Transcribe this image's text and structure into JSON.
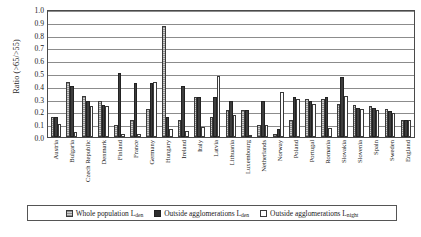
{
  "chart_data": {
    "type": "bar",
    "title": "",
    "xlabel": "",
    "ylabel": "Ratio (>65/>55)",
    "ylim": [
      0.0,
      1.0
    ],
    "yticks": [
      "1.0",
      "0.9",
      "0.8",
      "0.7",
      "0.6",
      "0.5",
      "0.4",
      "0.3",
      "0.2",
      "0.1",
      "0.0"
    ],
    "grid": true,
    "legend_position": "bottom",
    "categories": [
      "Austria",
      "Bulgaria",
      "Czech Republic",
      "Denmark",
      "Finland",
      "France",
      "Germany",
      "Hungary",
      "Ireland",
      "Italy",
      "Latvia",
      "Lithuania",
      "Luxembourg",
      "Netherlands",
      "Norway",
      "Poland",
      "Portugal",
      "Romania",
      "Slovakia",
      "Slovenia",
      "Spain",
      "Sweden",
      "England"
    ],
    "series": [
      {
        "name": "Whole population Lden",
        "name_main": "Whole population L",
        "name_sub": "den",
        "color": "#b9b9b9",
        "values": [
          0.16,
          0.43,
          0.32,
          0.28,
          0.09,
          0.13,
          0.22,
          0.87,
          0.13,
          0.31,
          0.16,
          0.21,
          0.21,
          0.09,
          0.02,
          0.13,
          0.3,
          0.3,
          0.26,
          0.25,
          0.24,
          0.22,
          0.13
        ]
      },
      {
        "name": "Outside agglomerations Lden",
        "name_main": "Outside agglomerations L",
        "name_sub": "den",
        "color": "#3d3d3d",
        "values": [
          0.16,
          0.4,
          0.28,
          0.25,
          0.5,
          0.42,
          0.42,
          0.16,
          0.4,
          0.31,
          0.31,
          0.28,
          0.21,
          0.28,
          0.06,
          0.31,
          0.28,
          0.31,
          0.47,
          0.23,
          0.23,
          0.2,
          0.13
        ]
      },
      {
        "name": "Outside agglomerations Lnight",
        "name_main": "Outside agglomerations L",
        "name_sub": "night",
        "color": "#ffffff",
        "values": [
          0.1,
          0.04,
          0.24,
          0.24,
          0.02,
          0.02,
          0.43,
          0.06,
          0.05,
          0.08,
          0.48,
          0.17,
          0.0,
          0.09,
          0.35,
          0.3,
          0.26,
          0.07,
          0.32,
          0.22,
          0.21,
          0.19,
          0.13
        ]
      }
    ]
  }
}
